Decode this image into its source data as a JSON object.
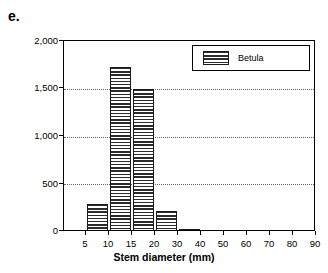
{
  "panel": {
    "label": "e."
  },
  "legend": {
    "position": "top-right-inside",
    "entries": [
      {
        "label": "Betula",
        "pattern": "horizontal-hatch"
      }
    ]
  },
  "colors": {
    "axis": "#000000",
    "gridline": "#666666",
    "bar_hatch": "#2b2b2b",
    "bar_background": "#ffffff",
    "page_background": "#ffffff"
  },
  "chart_data": {
    "type": "bar",
    "title": "",
    "subtitle": "",
    "xlabel": "Stem diameter (mm)",
    "ylabel": "",
    "ylim": [
      0,
      2000
    ],
    "ytick_values": [
      0,
      500,
      1000,
      1500,
      2000
    ],
    "ytick_labels": [
      "0",
      "500",
      "1,000",
      "1,500",
      "2,000"
    ],
    "xtick_labels": [
      "5",
      "10",
      "15",
      "20",
      "30",
      "40",
      "50",
      "60",
      "70",
      "80",
      "90"
    ],
    "xtick_values": [
      5,
      10,
      15,
      20,
      30,
      40,
      50,
      60,
      70,
      80,
      90
    ],
    "x_axis_scale": "binned-nonlinear",
    "grid": "horizontal-dotted",
    "legend_position": "upper right",
    "categories": [
      "5-10",
      "10-15",
      "15-20",
      "20-30",
      "30-40"
    ],
    "series": [
      {
        "name": "Betula",
        "values": [
          300,
          1720,
          1500,
          220,
          20
        ]
      }
    ],
    "bars": [
      {
        "bin": "5-10",
        "x_start": 5,
        "x_end": 10,
        "value": 300
      },
      {
        "bin": "10-15",
        "x_start": 10,
        "x_end": 15,
        "value": 1720
      },
      {
        "bin": "15-20",
        "x_start": 15,
        "x_end": 20,
        "value": 1500
      },
      {
        "bin": "20-30",
        "x_start": 20,
        "x_end": 30,
        "value": 220
      },
      {
        "bin": "30-40",
        "x_start": 30,
        "x_end": 40,
        "value": 20
      }
    ]
  },
  "geometry": {
    "plot_left": 63,
    "plot_top": 40,
    "plot_width": 252,
    "plot_height": 191,
    "xtick_px": [
      22,
      45,
      68,
      91,
      114,
      137,
      160,
      183,
      206,
      229,
      252
    ],
    "bars_px": [
      {
        "left": 23,
        "width": 21,
        "top": 163,
        "height": 28
      },
      {
        "left": 46,
        "width": 21,
        "top": 26,
        "height": 165
      },
      {
        "left": 69,
        "width": 21,
        "top": 48,
        "height": 143
      },
      {
        "left": 92,
        "width": 21,
        "top": 170,
        "height": 21
      },
      {
        "left": 115,
        "width": 21,
        "top": 188,
        "height": 3
      }
    ],
    "gridlines_px": [
      47.75,
      95.5,
      143.25
    ],
    "ylabels_px": [
      36,
      83,
      131,
      179,
      226
    ]
  }
}
